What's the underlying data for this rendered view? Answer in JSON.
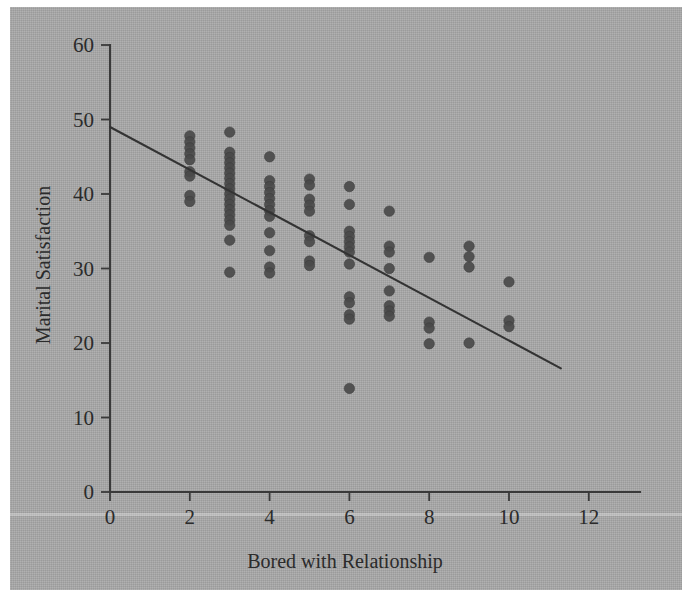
{
  "figure": {
    "background_color": "#a8a8a8",
    "marker_color": "#4a4a4a",
    "axis_color": "#3a3a3a",
    "line_color": "#333333"
  },
  "chart_data": {
    "type": "scatter",
    "title": "",
    "xlabel": "Bored with Relationship",
    "ylabel": "Marital Satisfaction",
    "xlim": [
      0,
      13.2
    ],
    "ylim": [
      0,
      60
    ],
    "xticks": [
      0,
      2,
      4,
      6,
      8,
      10,
      12
    ],
    "xticklabels": [
      "0",
      "2",
      "4",
      "6",
      "8",
      "10",
      "12"
    ],
    "yticks": [
      0,
      10,
      20,
      30,
      40,
      50,
      60
    ],
    "yticklabels": [
      "0",
      "10",
      "20",
      "30",
      "40",
      "50",
      "60"
    ],
    "grid": false,
    "legend": null,
    "points": [
      [
        2,
        47.8
      ],
      [
        2,
        47.0
      ],
      [
        2,
        46.2
      ],
      [
        2,
        45.4
      ],
      [
        2,
        44.6
      ],
      [
        2,
        43.0
      ],
      [
        2,
        42.4
      ],
      [
        2,
        39.8
      ],
      [
        2,
        39.0
      ],
      [
        3,
        48.3
      ],
      [
        3,
        45.6
      ],
      [
        3,
        44.9
      ],
      [
        3,
        44.2
      ],
      [
        3,
        43.5
      ],
      [
        3,
        42.8
      ],
      [
        3,
        42.1
      ],
      [
        3,
        41.4
      ],
      [
        3,
        40.7
      ],
      [
        3,
        40.0
      ],
      [
        3,
        39.3
      ],
      [
        3,
        38.6
      ],
      [
        3,
        37.9
      ],
      [
        3,
        37.2
      ],
      [
        3,
        36.5
      ],
      [
        3,
        35.8
      ],
      [
        3,
        33.8
      ],
      [
        3,
        29.5
      ],
      [
        4,
        45.0
      ],
      [
        4,
        41.8
      ],
      [
        4,
        41.0
      ],
      [
        4,
        40.2
      ],
      [
        4,
        39.4
      ],
      [
        4,
        38.6
      ],
      [
        4,
        37.8
      ],
      [
        4,
        37.0
      ],
      [
        4,
        34.8
      ],
      [
        4,
        32.4
      ],
      [
        4,
        30.2
      ],
      [
        4,
        29.4
      ],
      [
        5,
        42.0
      ],
      [
        5,
        41.2
      ],
      [
        5,
        39.3
      ],
      [
        5,
        38.5
      ],
      [
        5,
        37.7
      ],
      [
        5,
        34.4
      ],
      [
        5,
        33.6
      ],
      [
        5,
        31.0
      ],
      [
        5,
        30.4
      ],
      [
        6,
        41.0
      ],
      [
        6,
        38.6
      ],
      [
        6,
        35.0
      ],
      [
        6,
        34.3
      ],
      [
        6,
        33.6
      ],
      [
        6,
        32.9
      ],
      [
        6,
        32.2
      ],
      [
        6,
        30.6
      ],
      [
        6,
        26.2
      ],
      [
        6,
        25.4
      ],
      [
        6,
        23.8
      ],
      [
        6,
        23.2
      ],
      [
        6,
        13.9
      ],
      [
        7,
        37.7
      ],
      [
        7,
        33.0
      ],
      [
        7,
        32.2
      ],
      [
        7,
        30.0
      ],
      [
        7,
        27.0
      ],
      [
        7,
        25.0
      ],
      [
        7,
        24.3
      ],
      [
        7,
        23.6
      ],
      [
        8,
        31.5
      ],
      [
        8,
        22.8
      ],
      [
        8,
        22.0
      ],
      [
        8,
        19.9
      ],
      [
        9,
        33.0
      ],
      [
        9,
        31.6
      ],
      [
        9,
        30.2
      ],
      [
        9,
        20.0
      ],
      [
        10,
        28.2
      ],
      [
        10,
        23.0
      ],
      [
        10,
        22.2
      ]
    ],
    "fit_line": {
      "name": "regression line",
      "x_start": 0,
      "y_start": 49.0,
      "x_end": 11.3,
      "y_end": 16.6
    }
  }
}
